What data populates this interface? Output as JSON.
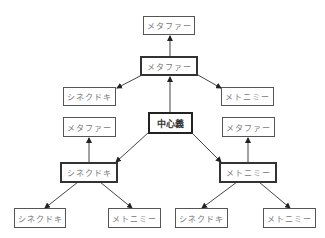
{
  "diagram": {
    "nodes": {
      "center": "中心義",
      "top_metaphor": "メタファー",
      "upper_metaphor": "メタファー",
      "upper_synecdoche": "シネクドキ",
      "upper_metonymy": "メトニミー",
      "left_metaphor": "メタファー",
      "left_synecdoche": "シネクドキ",
      "right_metaphor": "メタファー",
      "right_metonymy": "メトニミー",
      "bottom_ll_synecdoche": "シネクドキ",
      "bottom_lr_metonymy": "メトニミー",
      "bottom_rl_synecdoche": "シネクドキ",
      "bottom_rr_metonymy": "メトニミー"
    },
    "edges": [
      {
        "from": "center",
        "to": "upper_metaphor"
      },
      {
        "from": "upper_metaphor",
        "to": "top_metaphor"
      },
      {
        "from": "upper_metaphor",
        "to": "upper_synecdoche"
      },
      {
        "from": "upper_metaphor",
        "to": "upper_metonymy"
      },
      {
        "from": "center",
        "to": "left_synecdoche"
      },
      {
        "from": "center",
        "to": "right_metonymy"
      },
      {
        "from": "left_synecdoche",
        "to": "left_metaphor"
      },
      {
        "from": "right_metonymy",
        "to": "right_metaphor"
      },
      {
        "from": "left_synecdoche",
        "to": "bottom_ll_synecdoche"
      },
      {
        "from": "left_synecdoche",
        "to": "bottom_lr_metonymy"
      },
      {
        "from": "right_metonymy",
        "to": "bottom_rl_synecdoche"
      },
      {
        "from": "right_metonymy",
        "to": "bottom_rr_metonymy"
      }
    ]
  }
}
